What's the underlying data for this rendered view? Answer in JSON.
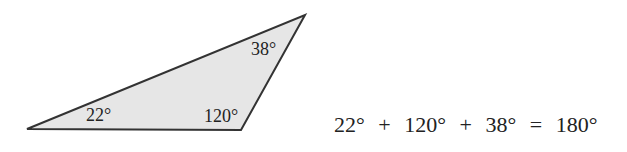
{
  "triangle": {
    "fill": "#e6e6e6",
    "stroke": "#333333",
    "angles": {
      "left": "22°",
      "bottom_right": "120°",
      "top": "38°"
    }
  },
  "equation": {
    "term1": "22°",
    "plus1": "+",
    "term2": "120°",
    "plus2": "+",
    "term3": "38°",
    "equals": "=",
    "result": "180°"
  }
}
